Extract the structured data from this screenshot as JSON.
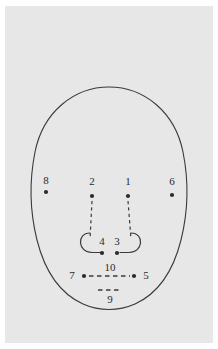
{
  "figure": {
    "kind": "anatomical-landmark-schematic",
    "colors": {
      "page_background": "#ffffff",
      "plate_background": "#e7e7e7",
      "ink": "#3a3a3a",
      "label_text": "#2b2b2b",
      "point_fill": "#2b2b2b"
    },
    "outline": {
      "name": "face-oval",
      "shape": "egg-oval",
      "center_x": 109,
      "center_y": 198,
      "top_y": 87,
      "bottom_y": 309,
      "left_x": 30,
      "right_x": 187,
      "stroke_width": 1.1
    },
    "nose": {
      "name": "nose-outline",
      "left_ala_x": 88,
      "right_ala_x": 130,
      "base_y": 252,
      "bridge_top_y": 196
    },
    "points": [
      {
        "id": 1,
        "label": "1",
        "name": "point-1",
        "x": 128,
        "y": 196,
        "label_x": 128,
        "label_y": 181,
        "label_anchor": "above"
      },
      {
        "id": 2,
        "label": "2",
        "name": "point-2",
        "x": 92,
        "y": 196,
        "label_x": 92,
        "label_y": 181,
        "label_anchor": "above"
      },
      {
        "id": 3,
        "label": "3",
        "name": "point-3",
        "x": 117,
        "y": 253,
        "label_x": 117,
        "label_y": 241,
        "label_anchor": "above"
      },
      {
        "id": 4,
        "label": "4",
        "name": "point-4",
        "x": 102,
        "y": 253,
        "label_x": 102,
        "label_y": 241,
        "label_anchor": "above"
      },
      {
        "id": 5,
        "label": "5",
        "name": "point-5",
        "x": 134,
        "y": 276,
        "label_x": 146,
        "label_y": 275,
        "label_anchor": "right"
      },
      {
        "id": 6,
        "label": "6",
        "name": "point-6",
        "x": 172,
        "y": 195,
        "label_x": 172,
        "label_y": 181,
        "label_anchor": "above"
      },
      {
        "id": 7,
        "label": "7",
        "name": "point-7",
        "x": 84,
        "y": 276,
        "label_x": 72,
        "label_y": 275,
        "label_anchor": "left"
      },
      {
        "id": 8,
        "label": "8",
        "name": "point-8",
        "x": 46,
        "y": 192,
        "label_x": 46,
        "label_y": 180,
        "label_anchor": "above"
      }
    ],
    "measures": [
      {
        "id": 9,
        "label": "9",
        "name": "measure-9",
        "style": "dashed",
        "x1": 98,
        "y1": 290,
        "x2": 122,
        "y2": 290,
        "label_x": 110,
        "label_y": 299
      },
      {
        "id": 10,
        "label": "10",
        "name": "measure-10",
        "style": "dashed",
        "x1": 89,
        "y1": 276,
        "x2": 130,
        "y2": 276,
        "label_x": 110,
        "label_y": 267
      }
    ],
    "connectors": [
      {
        "name": "connector-nose-left",
        "style": "dashed",
        "x1": 92,
        "y1": 201,
        "x2": 90,
        "y2": 239
      },
      {
        "name": "connector-nose-right",
        "style": "dashed",
        "x1": 128,
        "y1": 201,
        "x2": 131,
        "y2": 239
      }
    ]
  }
}
